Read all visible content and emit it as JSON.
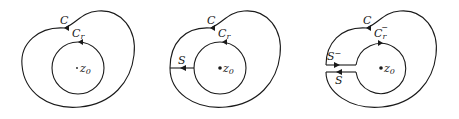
{
  "diagram": {
    "panels": [
      {
        "id": "panel-1",
        "outer_contour": "C",
        "inner_circle": "C",
        "inner_circle_sub": "r",
        "center_label": "z",
        "center_sub": "0",
        "center_dot": "small"
      },
      {
        "id": "panel-2",
        "outer_contour": "C",
        "inner_circle": "C",
        "inner_circle_sub": "r",
        "cut_label": "S",
        "center_label": "z",
        "center_sub": "0",
        "center_dot": "bold"
      },
      {
        "id": "panel-3",
        "outer_contour": "C",
        "inner_circle": "C",
        "inner_circle_sub": "r",
        "inner_circle_sup": "−",
        "cut_upper_label": "S",
        "cut_upper_sup": "−",
        "cut_lower_label": "S",
        "center_label": "z",
        "center_sub": "0",
        "center_dot": "bold"
      }
    ],
    "colors": {
      "stroke": "#1a1a1a",
      "background": "#ffffff"
    }
  }
}
